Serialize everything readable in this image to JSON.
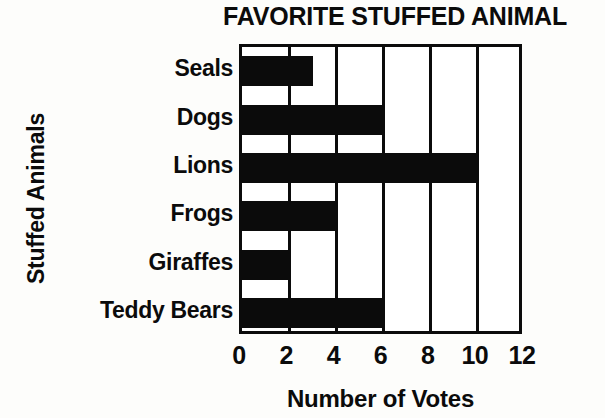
{
  "chart_data": {
    "type": "bar",
    "orientation": "horizontal",
    "title": "FAVORITE STUFFED ANIMAL",
    "xlabel": "Number of Votes",
    "ylabel": "Stuffed Animals",
    "categories": [
      "Seals",
      "Dogs",
      "Lions",
      "Frogs",
      "Giraffes",
      "Teddy Bears"
    ],
    "values": [
      3,
      6,
      10,
      4,
      2,
      6
    ],
    "xlim": [
      0,
      12
    ],
    "xticks": [
      0,
      2,
      4,
      6,
      8,
      10,
      12
    ],
    "xtick_labels": [
      "0",
      "2",
      "4",
      "6",
      "8",
      "10",
      "12"
    ],
    "grid": true,
    "grid_axis": "x",
    "legend": false,
    "bar_color": "#0b0b0b",
    "background_color": "#ffffff",
    "axis_color": "#0b0b0b"
  }
}
